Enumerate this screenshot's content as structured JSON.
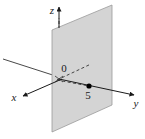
{
  "figure": {
    "background_color": "#ffffff",
    "plane": {
      "name": "plane-y-equals-5",
      "fill_color": "#d4d4d4",
      "stroke_color": "#8c8c8c",
      "description": "shaded vertical parallelogram parallel to the xz-plane"
    },
    "axes": [
      {
        "key": "x",
        "label": "x",
        "direction": "front-left",
        "arrow": true
      },
      {
        "key": "y",
        "label": "y",
        "direction": "right",
        "arrow": true
      },
      {
        "key": "z",
        "label": "z",
        "direction": "up",
        "arrow": true
      }
    ],
    "labels": {
      "x_axis": "x",
      "y_axis": "y",
      "z_axis": "z",
      "origin": "0",
      "marked_value": "5"
    },
    "point": {
      "name": "point-y-5",
      "label": "5",
      "color": "#000000",
      "on_axis": "y",
      "value": 5
    },
    "line_styles": {
      "solid": "#333333",
      "dashed": "#333333",
      "dash_pattern": "3,2"
    }
  }
}
